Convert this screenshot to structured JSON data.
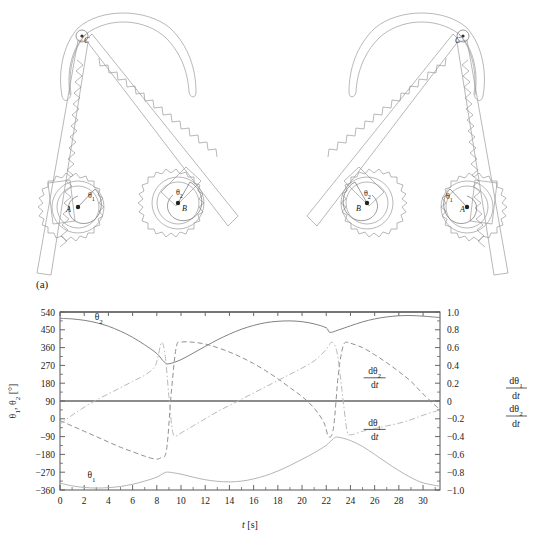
{
  "figure": {
    "panel_a_label": "(a)",
    "panel_b_label": "(b)"
  },
  "mechanism": {
    "caption": "Two-gear rack-and-pinion linkage mechanism, two configurations",
    "configurations": [
      {
        "name": "left-configuration",
        "pivot_label": "C",
        "gear_a_label": "A",
        "gear_b_label": "B",
        "angle_a_label": "θ",
        "angle_a_sub": "1",
        "angle_b_label": "θ",
        "angle_b_sub": "2"
      },
      {
        "name": "right-configuration",
        "pivot_label": "C",
        "gear_a_label": "A",
        "gear_b_label": "B",
        "angle_a_label": "θ",
        "angle_a_sub": "1",
        "angle_b_label": "θ",
        "angle_b_sub": "2"
      }
    ]
  },
  "chart_data": {
    "type": "line",
    "title": "",
    "xlabel": "t [s]",
    "ylabel_left_parts": [
      "θ",
      "1",
      ", θ",
      "2",
      " [°]"
    ],
    "ylabel_left": "θ1, θ2 [°]",
    "ylabel_right": "dθ1/dt  dθ2/dt",
    "xlim": [
      0,
      31.4
    ],
    "ylim_left": [
      -360,
      540
    ],
    "ylim_right": [
      -1.0,
      1.0
    ],
    "grid": false,
    "legend_position": "inline-annotations",
    "x_ticks": [
      0,
      2,
      4,
      6,
      8,
      10,
      12,
      14,
      16,
      18,
      20,
      22,
      24,
      26,
      28,
      30
    ],
    "x_tick_labels": [
      "0",
      "2",
      "4",
      "6",
      "8",
      "10",
      "12",
      "14",
      "16",
      "18",
      "20",
      "22",
      "24",
      "26",
      "28",
      "30"
    ],
    "y_ticks_left": [
      540,
      450,
      360,
      270,
      180,
      90,
      0,
      -90,
      -180,
      -270,
      -360
    ],
    "y_tick_labels_left": [
      "540",
      "450",
      "360",
      "270",
      "180",
      "90",
      "0",
      "‒90",
      "−180",
      "−270",
      "−360"
    ],
    "y_ticks_right": [
      1.0,
      0.8,
      0.6,
      0.4,
      0.2,
      0,
      -0.2,
      -0.4,
      -0.6,
      -0.8,
      -1.0
    ],
    "y_tick_labels_right": [
      "1.0",
      "0.8",
      "0.6",
      "0.4",
      "0.2",
      "0",
      "−0.2",
      "−0.4",
      "−0.6",
      "−0.8",
      "−1.0"
    ],
    "annotations": [
      {
        "name": "theta2-label",
        "text": "θ",
        "sub": "2",
        "x": 3.2,
        "y_left": 500
      },
      {
        "name": "theta1-label",
        "text": "θ",
        "sub": "1",
        "x": 2.6,
        "y_left": -300
      },
      {
        "name": "dtheta2-dt-label",
        "num": "dθ",
        "num_sub": "2",
        "den": "dt",
        "x": 26.0,
        "y_right": 0.3
      },
      {
        "name": "dtheta1-dt-label",
        "num": "dθ",
        "num_sub": "1",
        "den": "dt",
        "x": 26.0,
        "y_right": -0.28
      }
    ],
    "series": [
      {
        "name": "theta2",
        "label": "θ2",
        "axis": "left",
        "style": "solid",
        "color": "#7a7a7a",
        "x": [
          0,
          1,
          2,
          3,
          4,
          5,
          6,
          7,
          8,
          8.6,
          9,
          10,
          11,
          12,
          13,
          14,
          15,
          16,
          17,
          18,
          19,
          20,
          21,
          22,
          22.3,
          23,
          24,
          25,
          26,
          27,
          28,
          29,
          30,
          31.4
        ],
        "values": [
          508,
          505,
          498,
          486,
          468,
          443,
          412,
          374,
          330,
          288,
          278,
          299,
          332,
          366,
          399,
          428,
          453,
          472,
          486,
          493,
          495,
          491,
          480,
          460,
          437,
          449,
          470,
          490,
          505,
          515,
          521,
          522,
          519,
          512
        ]
      },
      {
        "name": "theta1",
        "label": "θ1",
        "axis": "left",
        "style": "solid",
        "color": "#b0b0b0",
        "x": [
          0,
          1,
          2,
          3,
          4,
          5,
          6,
          7,
          8,
          8.6,
          9,
          10,
          11,
          12,
          13,
          14,
          15,
          16,
          17,
          18,
          19,
          20,
          21,
          22,
          22.6,
          23,
          24,
          25,
          26,
          27,
          28,
          29,
          30,
          31.4
        ],
        "values": [
          -325,
          -339,
          -347,
          -350,
          -348,
          -342,
          -331,
          -315,
          -295,
          -274,
          -270,
          -280,
          -295,
          -308,
          -316,
          -319,
          -315,
          -304,
          -287,
          -264,
          -236,
          -205,
          -172,
          -134,
          -100,
          -93,
          -110,
          -140,
          -180,
          -222,
          -262,
          -297,
          -324,
          -341
        ]
      },
      {
        "name": "dtheta2-dt",
        "label": "dθ2/dt",
        "axis": "right",
        "style": "dashed",
        "color": "#8a8a8a",
        "x": [
          0,
          1,
          2,
          3,
          4,
          5,
          6,
          7,
          7.8,
          8.3,
          8.8,
          9.2,
          9.6,
          10,
          11,
          12,
          13,
          14,
          15,
          16,
          17,
          18,
          19,
          20,
          21,
          21.8,
          22.2,
          22.6,
          23.0,
          23.4,
          23.8,
          24,
          25,
          26,
          27,
          28,
          29,
          30,
          31.4
        ],
        "values": [
          -0.22,
          -0.28,
          -0.34,
          -0.4,
          -0.46,
          -0.52,
          -0.57,
          -0.62,
          -0.65,
          -0.64,
          -0.55,
          0.1,
          0.6,
          0.66,
          0.66,
          0.64,
          0.6,
          0.55,
          0.49,
          0.42,
          0.34,
          0.25,
          0.15,
          0.05,
          -0.08,
          -0.24,
          -0.4,
          -0.3,
          0.3,
          0.62,
          0.66,
          0.65,
          0.6,
          0.52,
          0.43,
          0.33,
          0.22,
          0.08,
          -0.1
        ]
      },
      {
        "name": "dtheta1-dt",
        "label": "dθ1/dt",
        "axis": "right",
        "style": "dashdot",
        "color": "#b5b5b5",
        "x": [
          0,
          1,
          2,
          3,
          4,
          5,
          6,
          7,
          7.8,
          8.1,
          8.4,
          8.7,
          9.0,
          9.3,
          9.6,
          10,
          11,
          12,
          13,
          14,
          15,
          16,
          17,
          18,
          19,
          20,
          21,
          21.8,
          22.2,
          22.5,
          22.9,
          23.3,
          23.7,
          24,
          25,
          26,
          27,
          28,
          29,
          30,
          31.4
        ],
        "values": [
          -0.26,
          -0.16,
          -0.07,
          0.01,
          0.08,
          0.15,
          0.22,
          0.29,
          0.38,
          0.5,
          0.66,
          0.5,
          0.05,
          -0.34,
          -0.39,
          -0.36,
          -0.28,
          -0.2,
          -0.12,
          -0.05,
          0.02,
          0.09,
          0.16,
          0.23,
          0.3,
          0.37,
          0.45,
          0.55,
          0.62,
          0.66,
          0.54,
          0.12,
          -0.32,
          -0.38,
          -0.34,
          -0.31,
          -0.28,
          -0.25,
          -0.21,
          -0.16,
          -0.1
        ]
      }
    ],
    "reference_lines": [
      {
        "name": "top-frame-line",
        "axis": "left",
        "value": 540
      },
      {
        "name": "zero-reference-line",
        "axis": "left",
        "value": 90
      }
    ]
  }
}
